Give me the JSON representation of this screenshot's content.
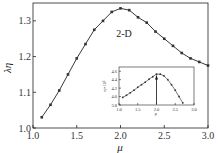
{
  "chart_data": [
    {
      "type": "line",
      "title": "",
      "annotation": "2-D",
      "xlabel": "μ",
      "ylabel": "λη",
      "xlim": [
        1.0,
        3.0
      ],
      "ylim": [
        1.0,
        1.35
      ],
      "xticks": [
        "1.0",
        "1.5",
        "2.0",
        "2.5",
        "3.0"
      ],
      "yticks": [
        "1.0",
        "1.1",
        "1.2",
        "1.3"
      ],
      "grid": false,
      "x": [
        1.1,
        1.2,
        1.3,
        1.4,
        1.5,
        1.6,
        1.7,
        1.8,
        1.9,
        2.0,
        2.1,
        2.2,
        2.3,
        2.4,
        2.5,
        2.6,
        2.7,
        2.8,
        2.9,
        3.0
      ],
      "values": [
        1.03,
        1.065,
        1.105,
        1.15,
        1.195,
        1.235,
        1.275,
        1.3,
        1.325,
        1.335,
        1.33,
        1.31,
        1.295,
        1.27,
        1.25,
        1.23,
        1.21,
        1.195,
        1.185,
        1.175
      ]
    },
    {
      "type": "line",
      "title": "inset",
      "xlabel": "μ",
      "ylabel": "η×10³",
      "xlim": [
        1.0,
        3.0
      ],
      "ylim": [
        3.8,
        4.7
      ],
      "xticks": [
        "1.0",
        "1.5",
        "2.0",
        "2.5",
        "3.0"
      ],
      "yticks": [
        "3.8",
        "4.0",
        "4.2",
        "4.4",
        "4.6"
      ],
      "x": [
        1.1,
        1.2,
        1.3,
        1.4,
        1.5,
        1.6,
        1.7,
        1.8,
        1.9,
        2.0,
        2.1,
        2.2,
        2.3,
        2.4,
        2.5,
        2.6,
        2.7
      ],
      "values": [
        3.98,
        4.03,
        4.09,
        4.15,
        4.22,
        4.28,
        4.34,
        4.41,
        4.47,
        4.53,
        4.53,
        4.49,
        4.4,
        4.28,
        4.15,
        4.0,
        3.85
      ],
      "annotation": "arrow at μ=2.0"
    }
  ]
}
